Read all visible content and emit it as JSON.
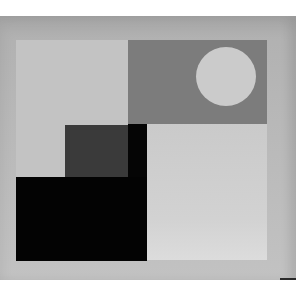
{
  "artwork": {
    "description": "Abstract geometric painting with rectangles and a circle in grayscale",
    "colors": {
      "background": "#ffffff",
      "frame": "#b8b8b8",
      "light_panel": "#c3c3c3",
      "mid_gray_panel": "#7c7c7c",
      "circle": "#cbcbcb",
      "pale_panel": "#d0d0d0",
      "dark_gray_square": "#3a3a3a",
      "black": "#030303"
    },
    "shapes": [
      {
        "name": "frame",
        "x": 0,
        "y": 16,
        "w": 296,
        "h": 264
      },
      {
        "name": "panel-top-left",
        "x": 16,
        "y": 40,
        "w": 112,
        "h": 137
      },
      {
        "name": "panel-top-right",
        "x": 128,
        "y": 40,
        "w": 139,
        "h": 84
      },
      {
        "name": "circle",
        "cx": 226,
        "cy": 76,
        "d": 60
      },
      {
        "name": "panel-bottom-right",
        "x": 147,
        "y": 124,
        "w": 120,
        "h": 136
      },
      {
        "name": "square-dark-gray",
        "x": 65,
        "y": 125,
        "w": 63,
        "h": 52
      },
      {
        "name": "strip-black",
        "x": 128,
        "y": 124,
        "w": 19,
        "h": 53
      },
      {
        "name": "block-black",
        "x": 16,
        "y": 177,
        "w": 131,
        "h": 84
      }
    ]
  }
}
